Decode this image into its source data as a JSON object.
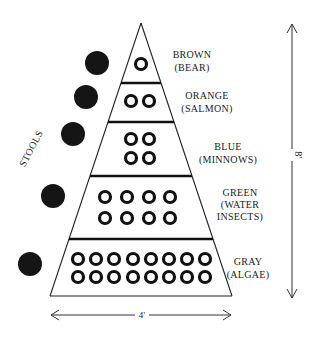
{
  "diagram": {
    "side_label": "STOOLS",
    "height_label": "8'",
    "width_label": "4'",
    "levels": [
      {
        "color": "BROWN",
        "organism": "(BEAR)",
        "rings": 1,
        "layout": [
          [
            1
          ]
        ]
      },
      {
        "color": "ORANGE",
        "organism": "(SALMON)",
        "rings": 2,
        "layout": [
          [
            2
          ]
        ]
      },
      {
        "color": "BLUE",
        "organism": "(MINNOWS)",
        "rings": 4,
        "layout": [
          [
            2
          ],
          [
            2
          ]
        ]
      },
      {
        "color": "GREEN",
        "organism_line1": "(WATER",
        "organism_line2": "INSECTS)",
        "rings": 8,
        "layout": [
          [
            4
          ],
          [
            4
          ]
        ]
      },
      {
        "color": "GRAY",
        "organism": "(ALGAE)",
        "rings": 16,
        "layout": [
          [
            8
          ],
          [
            8
          ]
        ]
      }
    ],
    "stools_count": 5
  }
}
